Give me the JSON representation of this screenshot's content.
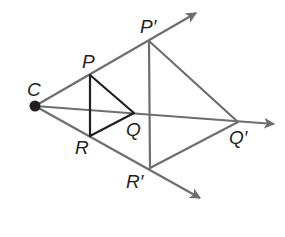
{
  "diagram": {
    "type": "dilation",
    "center": {
      "label": "C",
      "x": 35,
      "y": 106
    },
    "points": {
      "P": {
        "label": "P",
        "x": 90,
        "y": 75
      },
      "Q": {
        "label": "Q",
        "x": 134,
        "y": 113
      },
      "R": {
        "label": "R",
        "x": 90,
        "y": 136
      },
      "P2": {
        "label": "P′",
        "x": 149,
        "y": 41
      },
      "Q2": {
        "label": "Q′",
        "x": 238,
        "y": 122
      },
      "R2": {
        "label": "R′",
        "x": 150,
        "y": 168
      }
    },
    "rays": [
      {
        "from": "C",
        "through": "P′",
        "tip": [
          196,
          13
        ]
      },
      {
        "from": "C",
        "through": "Q′",
        "tip": [
          274,
          124
        ]
      },
      {
        "from": "C",
        "through": "R′",
        "tip": [
          200,
          198
        ]
      }
    ],
    "triangles": [
      {
        "name": "PQR",
        "vertices": [
          "P",
          "Q",
          "R"
        ],
        "color": "#231f20"
      },
      {
        "name": "P′Q′R′",
        "vertices": [
          "P′",
          "Q′",
          "R′"
        ],
        "color": "#6d6e71"
      }
    ],
    "colors": {
      "ray": "#6d6e71",
      "image_triangle": "#6d6e71",
      "pre_image_triangle": "#231f20",
      "center_dot": "#231f20",
      "label": "#231f20"
    }
  }
}
